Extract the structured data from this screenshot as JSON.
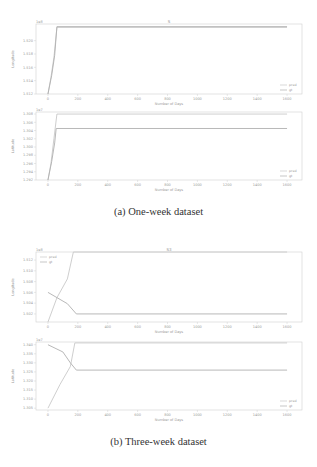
{
  "figure": {
    "caption_a": "(a) One-week dataset",
    "caption_b": "(b) Three-week dataset"
  },
  "colors": {
    "pred": "#c8c8c8",
    "gt": "#b0b0b0",
    "axis": "#d0d0d0",
    "text": "#9a9a9a"
  },
  "chart_data": [
    {
      "type": "line",
      "panel": "a-top",
      "title": "S",
      "offset_label": "1e8",
      "xlabel": "Number of Days",
      "ylabel": "Longitude",
      "xlim": [
        -80,
        1700
      ],
      "xticks": [
        0,
        200,
        400,
        600,
        800,
        1000,
        1200,
        1400,
        1600
      ],
      "yticks": [
        "1.512",
        "1.514",
        "1.516",
        "1.518",
        "1.520"
      ],
      "ylim": [
        1.512,
        1.5225
      ],
      "legend": [
        "pred",
        "gt"
      ],
      "legend_position": "lower right",
      "series": [
        {
          "name": "pred",
          "x": [
            0,
            20,
            40,
            60,
            1600
          ],
          "y": [
            1.512,
            1.5145,
            1.5175,
            1.522,
            1.522
          ]
        },
        {
          "name": "gt",
          "x": [
            0,
            25,
            45,
            60,
            1600
          ],
          "y": [
            1.512,
            1.5148,
            1.5178,
            1.5221,
            1.5221
          ]
        }
      ]
    },
    {
      "type": "line",
      "panel": "a-bottom",
      "title": "",
      "offset_label": "1e7",
      "xlabel": "Number of Days",
      "ylabel": "Latitude",
      "xlim": [
        -80,
        1700
      ],
      "xticks": [
        0,
        200,
        400,
        600,
        800,
        1000,
        1200,
        1400,
        1600
      ],
      "yticks": [
        "1.292",
        "1.294",
        "1.296",
        "1.298",
        "1.300",
        "1.302",
        "1.304",
        "1.306",
        "1.308"
      ],
      "ylim": [
        1.292,
        1.3085
      ],
      "legend": [
        "pred",
        "gt"
      ],
      "legend_position": "lower right",
      "series": [
        {
          "name": "pred",
          "x": [
            0,
            20,
            40,
            60,
            1600
          ],
          "y": [
            1.292,
            1.296,
            1.302,
            1.308,
            1.308
          ]
        },
        {
          "name": "gt",
          "x": [
            0,
            25,
            45,
            55,
            1600
          ],
          "y": [
            1.292,
            1.2965,
            1.301,
            1.3045,
            1.3045
          ]
        }
      ]
    },
    {
      "type": "line",
      "panel": "b-top",
      "title": "S3",
      "offset_label": "1e8",
      "xlabel": "Number of Days",
      "ylabel": "Longitude",
      "xlim": [
        -80,
        1700
      ],
      "xticks": [
        0,
        200,
        400,
        600,
        800,
        1000,
        1200,
        1400,
        1600
      ],
      "yticks": [
        "1.502",
        "1.504",
        "1.506",
        "1.508",
        "1.510",
        "1.512"
      ],
      "ylim": [
        1.5005,
        1.5135
      ],
      "legend": [
        "pred",
        "gt"
      ],
      "legend_position": "upper left",
      "series": [
        {
          "name": "pred",
          "x": [
            0,
            60,
            130,
            170,
            1600
          ],
          "y": [
            1.5005,
            1.505,
            1.5085,
            1.5135,
            1.5135
          ]
        },
        {
          "name": "gt",
          "x": [
            0,
            130,
            190,
            1600
          ],
          "y": [
            1.506,
            1.5039,
            1.502,
            1.502
          ]
        }
      ]
    },
    {
      "type": "line",
      "panel": "b-bottom",
      "title": "",
      "offset_label": "1e7",
      "xlabel": "Number of Days",
      "ylabel": "Latitude",
      "xlim": [
        -80,
        1700
      ],
      "xticks": [
        0,
        200,
        400,
        600,
        800,
        1000,
        1200,
        1400,
        1600
      ],
      "yticks": [
        "1.305",
        "1.310",
        "1.315",
        "1.320",
        "1.325",
        "1.330",
        "1.335",
        "1.340"
      ],
      "ylim": [
        1.304,
        1.3415
      ],
      "legend": [
        "pred",
        "gt"
      ],
      "legend_position": "lower right",
      "series": [
        {
          "name": "pred",
          "x": [
            0,
            80,
            150,
            180,
            1600
          ],
          "y": [
            1.305,
            1.318,
            1.328,
            1.341,
            1.341
          ]
        },
        {
          "name": "gt",
          "x": [
            0,
            100,
            150,
            190,
            1600
          ],
          "y": [
            1.34,
            1.336,
            1.33,
            1.326,
            1.326
          ]
        }
      ]
    }
  ]
}
